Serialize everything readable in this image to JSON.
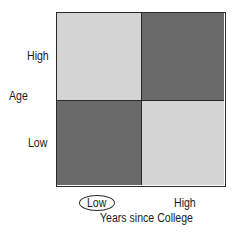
{
  "diagram": {
    "y_axis": {
      "title": "Age",
      "levels": [
        "High",
        "Low"
      ]
    },
    "x_axis": {
      "title": "Years since College",
      "levels": [
        "Low",
        "High"
      ],
      "highlighted_level": "Low"
    },
    "cells": [
      {
        "row": "High",
        "col": "Low",
        "shade": "light",
        "color": "#d4d4d4"
      },
      {
        "row": "High",
        "col": "High",
        "shade": "dark",
        "color": "#6a6a6a"
      },
      {
        "row": "Low",
        "col": "Low",
        "shade": "dark",
        "color": "#6a6a6a"
      },
      {
        "row": "Low",
        "col": "High",
        "shade": "light",
        "color": "#d4d4d4"
      }
    ]
  }
}
